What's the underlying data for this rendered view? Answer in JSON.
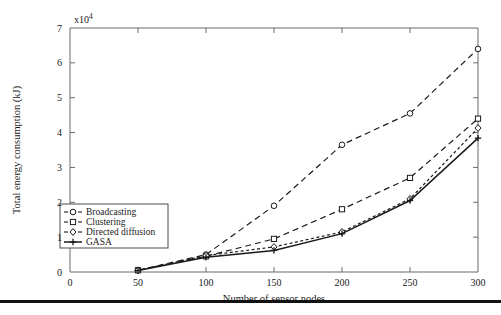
{
  "chart_data": {
    "type": "line",
    "title": "",
    "xlabel": "Number of sensor nodes",
    "ylabel": "Total energy consumption (kJ)",
    "y_multiplier": "x10",
    "y_multiplier_exponent": "4",
    "x": [
      50,
      100,
      150,
      200,
      250,
      300
    ],
    "xlim": [
      0,
      300
    ],
    "ylim": [
      0,
      7
    ],
    "xticks": [
      "0",
      "50",
      "100",
      "150",
      "200",
      "250",
      "300"
    ],
    "yticks": [
      "0",
      "1",
      "2",
      "3",
      "4",
      "5",
      "6",
      "7"
    ],
    "grid": false,
    "legend_position": "lower-left-inside",
    "series": [
      {
        "name": "Broadcasting",
        "marker": "circle",
        "linestyle": "dashed",
        "color": "#1a1a1a",
        "values": [
          0.05,
          0.5,
          1.9,
          3.65,
          4.55,
          6.4
        ]
      },
      {
        "name": "Clustering",
        "marker": "square",
        "linestyle": "dashed",
        "color": "#1a1a1a",
        "values": [
          0.05,
          0.45,
          0.95,
          1.8,
          2.7,
          4.4
        ]
      },
      {
        "name": "Directed diffusion",
        "marker": "diamond",
        "linestyle": "dashed",
        "color": "#1a1a1a",
        "values": [
          0.05,
          0.47,
          0.72,
          1.15,
          2.1,
          4.13
        ]
      },
      {
        "name": "GASA",
        "marker": "plus",
        "linestyle": "solid",
        "color": "#1a1a1a",
        "values": [
          0.04,
          0.42,
          0.62,
          1.1,
          2.05,
          3.84
        ]
      }
    ]
  },
  "legend": {
    "items": [
      {
        "label": "Broadcasting"
      },
      {
        "label": "Clustering"
      },
      {
        "label": "Directed diffusion"
      },
      {
        "label": "GASA"
      }
    ]
  }
}
